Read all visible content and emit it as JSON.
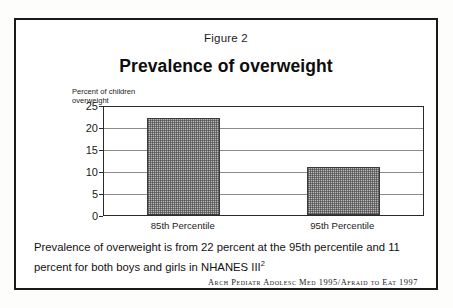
{
  "figure": {
    "number_label": "Figure 2",
    "title": "Prevalence of overweight",
    "caption": "Prevalence of overweight is from 22 percent at the 95th percentile and 11 percent for both boys and girls in NHANES III",
    "caption_superscript": "2",
    "citation": "Arch Pediatr Adolesc Med 1995/Afraid to Eat 1997"
  },
  "chart_data": {
    "type": "bar",
    "title": "Prevalence of overweight",
    "categories": [
      "85th Percentile",
      "95th Percentile"
    ],
    "values": [
      22,
      11
    ],
    "xlabel": "",
    "ylabel": "Percent of children overweight",
    "ylim": [
      0,
      25
    ],
    "yticks": [
      "0",
      "5",
      "10",
      "15",
      "20",
      "25"
    ],
    "grid": true,
    "legend": false,
    "bar_fill": "#b9b9b9",
    "bar_border": "#3a3a3a",
    "axis_color": "#2a2a2a",
    "gridline_color": "#8c8c8c"
  },
  "colors": {
    "frame": "#1a1a1a",
    "text": "#1c1c1c",
    "page_background": "#fdfdfc"
  }
}
